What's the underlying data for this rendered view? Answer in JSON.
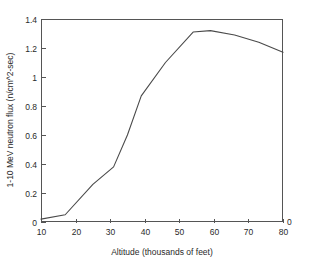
{
  "chart_data": {
    "type": "line",
    "title": "",
    "xlabel": "Altitude (thousands of feet)",
    "ylabel": "1-10 MeV neutron flux (n/cm^2-sec)",
    "xlim": [
      10,
      80
    ],
    "ylim": [
      0,
      1.4
    ],
    "grid": false,
    "legend": false,
    "legend_position": "none",
    "xticks": [
      10,
      20,
      30,
      40,
      50,
      60,
      70,
      80
    ],
    "xtick_labels": [
      "10",
      "20",
      "30",
      "40",
      "50",
      "60",
      "70",
      "80"
    ],
    "yticks": [
      0,
      0.2,
      0.4,
      0.6,
      0.8,
      1,
      1.2,
      1.4
    ],
    "ytick_labels": [
      "0",
      "0.2",
      "0.4",
      "0.6",
      "0.8",
      "1",
      "1.2",
      "1.4"
    ],
    "annotations": [
      {
        "name": "bottom-right-zero",
        "text": "0",
        "x": 80,
        "y": 0
      }
    ],
    "series": [
      {
        "name": "1-10 MeV neutron flux",
        "color": "#4a4a4a",
        "x": [
          10,
          17,
          25,
          31,
          35,
          39,
          46,
          54,
          59,
          66,
          73,
          80
        ],
        "values": [
          0.02,
          0.05,
          0.26,
          0.38,
          0.6,
          0.87,
          1.1,
          1.31,
          1.32,
          1.29,
          1.24,
          1.17
        ]
      }
    ]
  },
  "plot_geometry": {
    "left": 41,
    "right": 283,
    "top": 19,
    "bottom": 222
  }
}
